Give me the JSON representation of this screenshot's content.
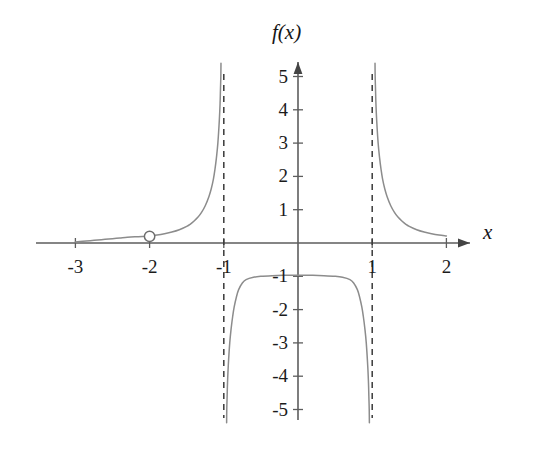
{
  "chart_data": {
    "type": "line",
    "title": "",
    "xlabel": "x",
    "ylabel": "f(x)",
    "xlim": [
      -3.35,
      2.35
    ],
    "ylim": [
      -5.5,
      5.6
    ],
    "grid": false,
    "legend": null,
    "x_ticks": [
      {
        "value": -3,
        "label": "-3"
      },
      {
        "value": -2,
        "label": "-2"
      },
      {
        "value": -1,
        "label": "-1"
      },
      {
        "value": 1,
        "label": "1"
      },
      {
        "value": 2,
        "label": "2"
      }
    ],
    "y_ticks": [
      {
        "value": 5,
        "label": "5"
      },
      {
        "value": 4,
        "label": "4"
      },
      {
        "value": 3,
        "label": "3"
      },
      {
        "value": 2,
        "label": "2"
      },
      {
        "value": 1,
        "label": "1"
      },
      {
        "value": -1,
        "label": "-1"
      },
      {
        "value": -2,
        "label": "-2"
      },
      {
        "value": -3,
        "label": "-3"
      },
      {
        "value": -4,
        "label": "-4"
      },
      {
        "value": -5,
        "label": "-5"
      }
    ],
    "asymptotes": [
      {
        "type": "vertical",
        "value": -1,
        "style": "dashed"
      },
      {
        "type": "vertical",
        "value": 1,
        "style": "dashed"
      }
    ],
    "open_points": [
      {
        "x": -2,
        "y": 0.2,
        "label": "removable discontinuity"
      }
    ],
    "series": [
      {
        "name": "left-branch",
        "domain": [
          -3,
          -1
        ],
        "points": [
          [
            -3.0,
            0.03
          ],
          [
            -2.9,
            0.05
          ],
          [
            -2.8,
            0.07
          ],
          [
            -2.7,
            0.09
          ],
          [
            -2.6,
            0.11
          ],
          [
            -2.5,
            0.13
          ],
          [
            -2.4,
            0.15
          ],
          [
            -2.3,
            0.17
          ],
          [
            -2.2,
            0.185
          ],
          [
            -2.1,
            0.195
          ],
          [
            -2.0,
            0.21
          ],
          [
            -1.9,
            0.24
          ],
          [
            -1.8,
            0.28
          ],
          [
            -1.7,
            0.33
          ],
          [
            -1.6,
            0.4
          ],
          [
            -1.5,
            0.5
          ],
          [
            -1.45,
            0.57
          ],
          [
            -1.4,
            0.66
          ],
          [
            -1.35,
            0.77
          ],
          [
            -1.3,
            0.92
          ],
          [
            -1.25,
            1.12
          ],
          [
            -1.2,
            1.4
          ],
          [
            -1.17,
            1.62
          ],
          [
            -1.14,
            1.92
          ],
          [
            -1.12,
            2.2
          ],
          [
            -1.1,
            2.55
          ],
          [
            -1.08,
            3.0
          ],
          [
            -1.06,
            3.7
          ],
          [
            -1.05,
            4.2
          ],
          [
            -1.045,
            4.6
          ],
          [
            -1.04,
            5.0
          ],
          [
            -1.038,
            5.4
          ]
        ]
      },
      {
        "name": "middle-branch",
        "domain": [
          -1,
          1
        ],
        "points": [
          [
            -0.962,
            -5.4
          ],
          [
            -0.96,
            -5.0
          ],
          [
            -0.955,
            -4.6
          ],
          [
            -0.95,
            -4.2
          ],
          [
            -0.94,
            -3.7
          ],
          [
            -0.92,
            -3.0
          ],
          [
            -0.9,
            -2.55
          ],
          [
            -0.88,
            -2.2
          ],
          [
            -0.86,
            -1.92
          ],
          [
            -0.83,
            -1.62
          ],
          [
            -0.8,
            -1.4
          ],
          [
            -0.75,
            -1.2
          ],
          [
            -0.7,
            -1.1
          ],
          [
            -0.6,
            -1.03
          ],
          [
            -0.5,
            -1.0
          ],
          [
            -0.35,
            -0.98
          ],
          [
            -0.2,
            -0.97
          ],
          [
            0.0,
            -0.97
          ],
          [
            0.2,
            -0.97
          ],
          [
            0.35,
            -0.98
          ],
          [
            0.5,
            -1.0
          ],
          [
            0.6,
            -1.03
          ],
          [
            0.7,
            -1.1
          ],
          [
            0.75,
            -1.2
          ],
          [
            0.8,
            -1.4
          ],
          [
            0.83,
            -1.62
          ],
          [
            0.86,
            -1.92
          ],
          [
            0.88,
            -2.2
          ],
          [
            0.9,
            -2.55
          ],
          [
            0.92,
            -3.0
          ],
          [
            0.94,
            -3.7
          ],
          [
            0.95,
            -4.2
          ],
          [
            0.955,
            -4.6
          ],
          [
            0.96,
            -5.0
          ],
          [
            0.962,
            -5.4
          ]
        ]
      },
      {
        "name": "right-branch",
        "domain": [
          1,
          2
        ],
        "points": [
          [
            1.038,
            5.4
          ],
          [
            1.04,
            5.0
          ],
          [
            1.045,
            4.6
          ],
          [
            1.05,
            4.2
          ],
          [
            1.06,
            3.7
          ],
          [
            1.08,
            3.0
          ],
          [
            1.1,
            2.55
          ],
          [
            1.12,
            2.2
          ],
          [
            1.14,
            1.92
          ],
          [
            1.17,
            1.62
          ],
          [
            1.2,
            1.4
          ],
          [
            1.25,
            1.12
          ],
          [
            1.3,
            0.92
          ],
          [
            1.35,
            0.77
          ],
          [
            1.4,
            0.66
          ],
          [
            1.45,
            0.57
          ],
          [
            1.5,
            0.5
          ],
          [
            1.6,
            0.4
          ],
          [
            1.7,
            0.33
          ],
          [
            1.8,
            0.28
          ],
          [
            1.9,
            0.24
          ],
          [
            2.0,
            0.21
          ]
        ]
      }
    ],
    "colors": {
      "curve": "#8c8c8c",
      "axis": "#5d5d5d",
      "asymptote": "#3a3a3a",
      "text": "#1b1b1b",
      "background": "#ffffff"
    }
  }
}
